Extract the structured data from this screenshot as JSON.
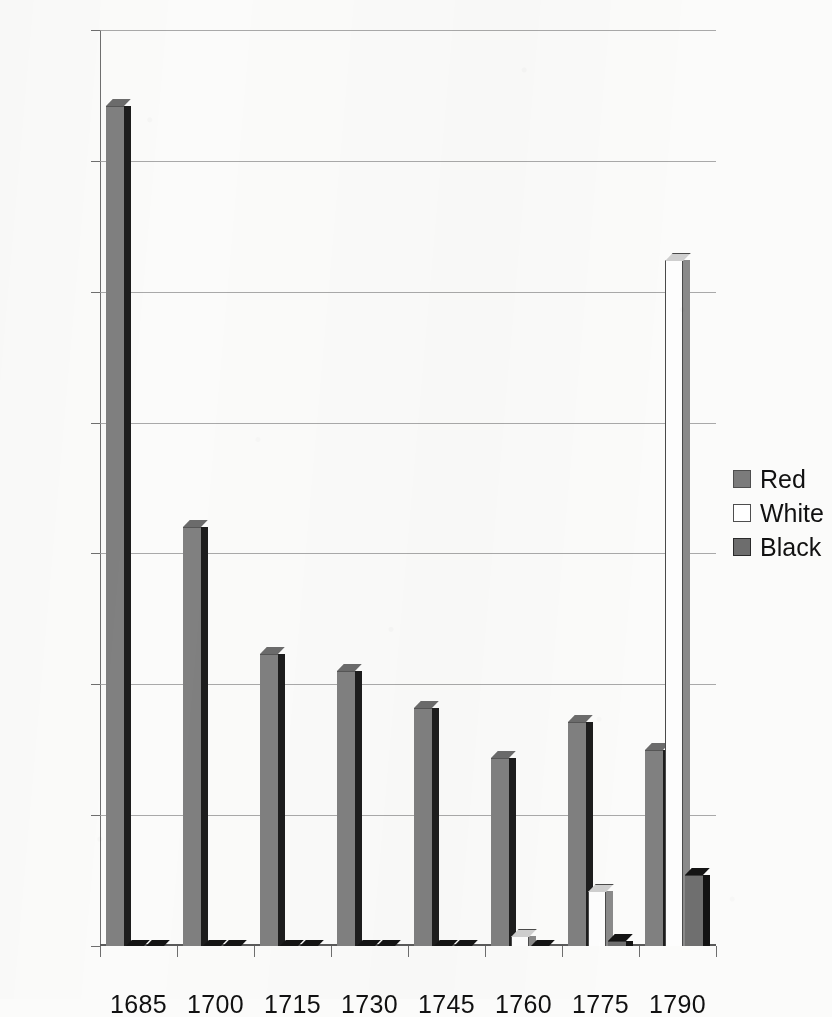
{
  "chart_data": {
    "type": "bar",
    "title": "",
    "subtitle": "",
    "xlabel": "",
    "ylabel": "",
    "categories": [
      "1685",
      "1700",
      "1715",
      "1730",
      "1745",
      "1760",
      "1775",
      "1790"
    ],
    "series": [
      {
        "name": "Red",
        "color": "#808080",
        "values": [
          32100,
          16000,
          11150,
          10500,
          9100,
          7200,
          8550,
          7500
        ]
      },
      {
        "name": "White",
        "color": "#ffffff",
        "values": [
          0,
          0,
          0,
          0,
          0,
          400,
          2100,
          26200
        ]
      },
      {
        "name": "Black",
        "color": "#6f6f6f",
        "values": [
          0,
          0,
          0,
          0,
          0,
          150,
          200,
          2700
        ]
      }
    ],
    "ylim": [
      0,
      35000
    ],
    "ytick_values": [
      0,
      5000,
      10000,
      15000,
      20000,
      25000,
      30000,
      35000
    ],
    "ytick_labels": [
      "0",
      "5000",
      "10000",
      "15000",
      "20000",
      "25000",
      "30000",
      "35000"
    ],
    "grid": true,
    "grid_axis": "y",
    "legend_position": "right-middle",
    "legend_entries": [
      "Red",
      "White",
      "Black"
    ],
    "style": "3d-grayscale-clustered-columns"
  }
}
